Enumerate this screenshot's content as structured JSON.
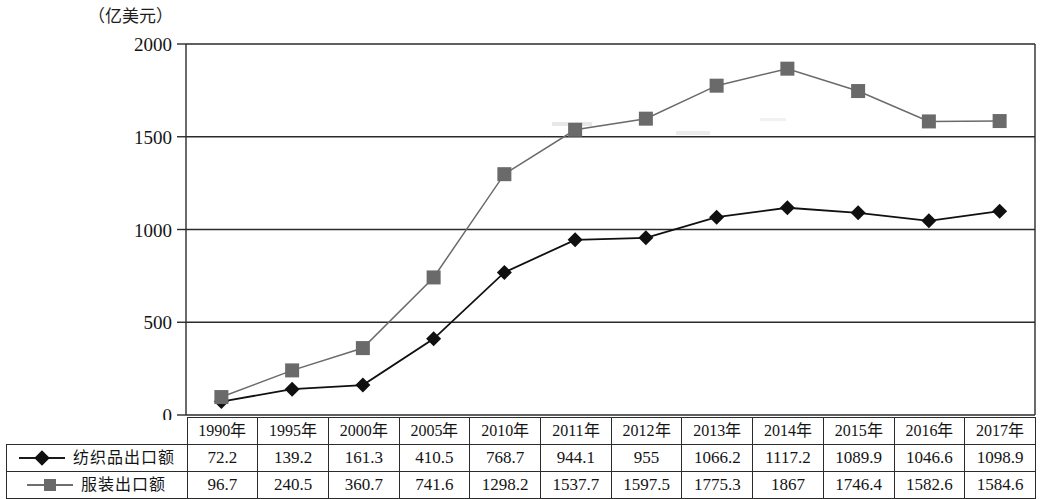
{
  "axis": {
    "unit_label": "（亿美元）",
    "y_ticks": [
      "2000",
      "1500",
      "1000",
      "500",
      "0"
    ],
    "y_min": 0,
    "y_max": 2000
  },
  "table": {
    "corner": "",
    "headers": [
      "1990年",
      "1995年",
      "2000年",
      "2005年",
      "2010年",
      "2011年",
      "2012年",
      "2013年",
      "2014年",
      "2015年",
      "2016年",
      "2017年"
    ],
    "rows": [
      {
        "label": "纺织品出口额",
        "marker": "diamond-marker",
        "values": [
          "72.2",
          "139.2",
          "161.3",
          "410.5",
          "768.7",
          "944.1",
          "955",
          "1066.2",
          "1117.2",
          "1089.9",
          "1046.6",
          "1098.9"
        ]
      },
      {
        "label": "服装出口额",
        "marker": "square-marker",
        "values": [
          "96.7",
          "240.5",
          "360.7",
          "741.6",
          "1298.2",
          "1537.7",
          "1597.5",
          "1775.3",
          "1867",
          "1746.4",
          "1582.6",
          "1584.6"
        ]
      }
    ]
  },
  "colors": {
    "series_textile": "#101010",
    "series_apparel": "#6a6a6a",
    "grid": "#2b2b2b",
    "axis": "#2b2b2b"
  },
  "chart_data": {
    "type": "line",
    "title": "",
    "xlabel": "",
    "ylabel": "（亿美元）",
    "ylim": [
      0,
      2000
    ],
    "yticks": [
      0,
      500,
      1000,
      1500,
      2000
    ],
    "grid": true,
    "legend_position": "table-left-column",
    "categories": [
      "1990年",
      "1995年",
      "2000年",
      "2005年",
      "2010年",
      "2011年",
      "2012年",
      "2013年",
      "2014年",
      "2015年",
      "2016年",
      "2017年"
    ],
    "series": [
      {
        "name": "纺织品出口额",
        "marker": "diamond",
        "color": "#101010",
        "values": [
          72.2,
          139.2,
          161.3,
          410.5,
          768.7,
          944.1,
          955,
          1066.2,
          1117.2,
          1089.9,
          1046.6,
          1098.9
        ]
      },
      {
        "name": "服装出口额",
        "marker": "square",
        "color": "#6a6a6a",
        "values": [
          96.7,
          240.5,
          360.7,
          741.6,
          1298.2,
          1537.7,
          1597.5,
          1775.3,
          1867,
          1746.4,
          1582.6,
          1584.6
        ]
      }
    ]
  }
}
